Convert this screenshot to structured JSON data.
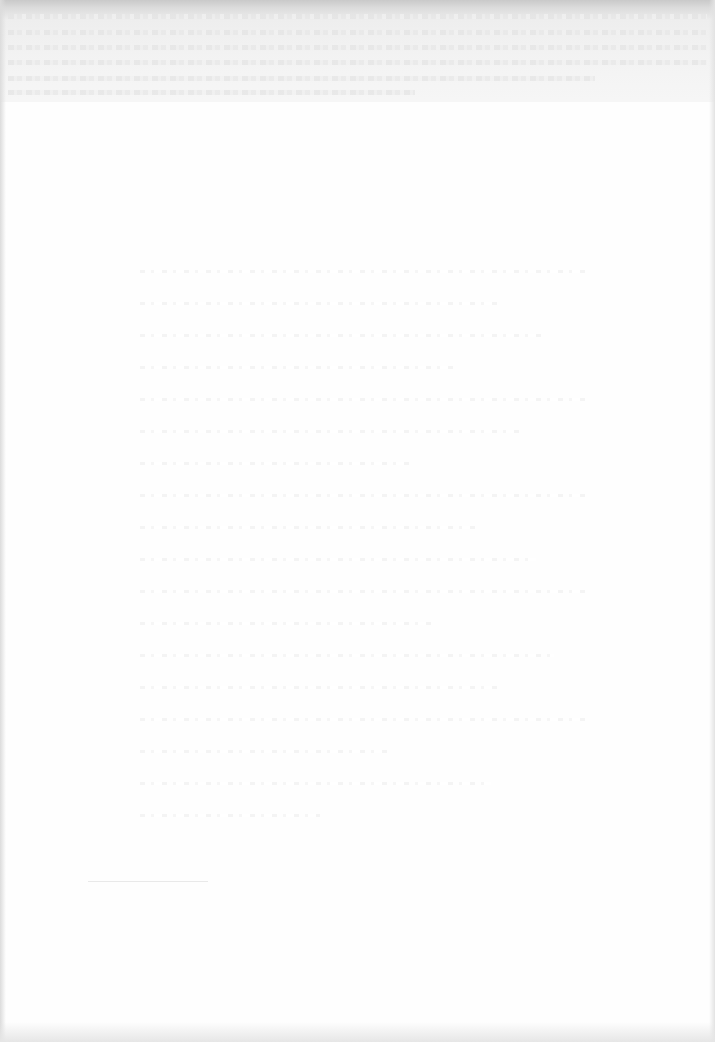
{
  "document": {
    "type": "scanned-page",
    "condition": "heavily overexposed / faded; text largely illegible",
    "header": {
      "running_head": "",
      "legible": false
    },
    "body": {
      "paragraph_line_count_estimate": 18,
      "legible": false
    },
    "footnote": {
      "text": "",
      "legible": false
    },
    "folio": {
      "text": "",
      "legible": false
    }
  },
  "colors": {
    "paper": "#fefefe",
    "scan_band": "#d0d0d0",
    "faint_ink": "#e6e6e6"
  }
}
